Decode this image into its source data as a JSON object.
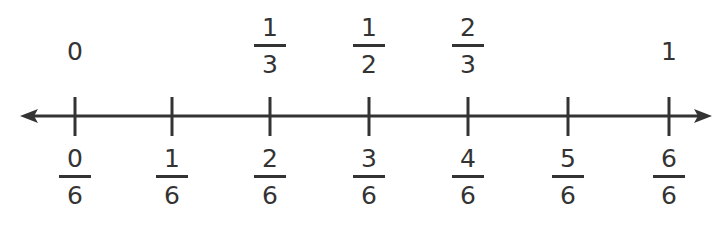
{
  "diagram": {
    "type": "number_line",
    "line_color": "#333333",
    "range": [
      0,
      1
    ],
    "top_labels": [
      {
        "kind": "whole",
        "value": "0",
        "position": 0
      },
      {
        "kind": "fraction",
        "numerator": "1",
        "denominator": "3",
        "position": 2
      },
      {
        "kind": "fraction",
        "numerator": "1",
        "denominator": "2",
        "position": 3
      },
      {
        "kind": "fraction",
        "numerator": "2",
        "denominator": "3",
        "position": 4
      },
      {
        "kind": "whole",
        "value": "1",
        "position": 6
      }
    ],
    "bottom_labels": [
      {
        "numerator": "0",
        "denominator": "6"
      },
      {
        "numerator": "1",
        "denominator": "6"
      },
      {
        "numerator": "2",
        "denominator": "6"
      },
      {
        "numerator": "3",
        "denominator": "6"
      },
      {
        "numerator": "4",
        "denominator": "6"
      },
      {
        "numerator": "5",
        "denominator": "6"
      },
      {
        "numerator": "6",
        "denominator": "6"
      }
    ],
    "tick_count": 7
  }
}
